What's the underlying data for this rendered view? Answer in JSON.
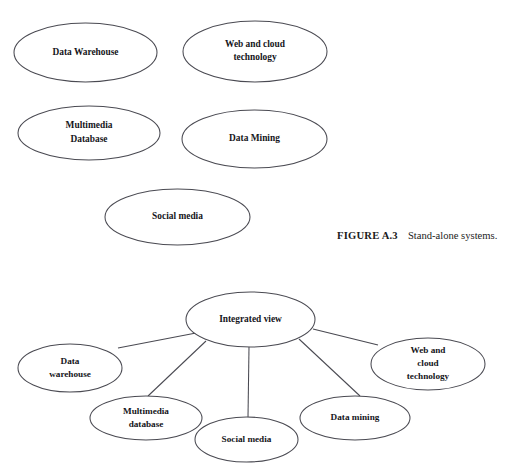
{
  "figure": {
    "caption_tag": "FIGURE A.3",
    "caption_text": "Stand-alone systems.",
    "background_color": "#ffffff",
    "stroke_color": "#4a4a52",
    "text_color": "#15151a"
  },
  "standalone_diagram": {
    "name": "stand-alone-systems",
    "nodes": [
      {
        "id": "data-warehouse",
        "lines": [
          "Data Warehouse"
        ],
        "cx": 85.5,
        "cy": 52.5,
        "rx": 71.5,
        "ry": 29.5,
        "font_size": 9.4
      },
      {
        "id": "web-and-cloud-technology",
        "lines": [
          "Web and cloud",
          "technology"
        ],
        "cx": 255,
        "cy": 51.5,
        "rx": 72,
        "ry": 30.5,
        "font_size": 9.4
      },
      {
        "id": "multimedia-database",
        "lines": [
          "Multimedia",
          "Database"
        ],
        "cx": 89,
        "cy": 133,
        "rx": 71,
        "ry": 27,
        "font_size": 9.4
      },
      {
        "id": "data-mining",
        "lines": [
          "Data Mining"
        ],
        "cx": 254.5,
        "cy": 139,
        "rx": 72.5,
        "ry": 29,
        "font_size": 9.4
      },
      {
        "id": "social-media",
        "lines": [
          "Social media"
        ],
        "cx": 177.5,
        "cy": 217,
        "rx": 72.5,
        "ry": 28,
        "font_size": 9.4
      }
    ]
  },
  "integrated_diagram": {
    "name": "integrated-view-systems",
    "center_node": {
      "id": "integrated-view",
      "lines": [
        "Integrated view"
      ],
      "cx": 250.5,
      "cy": 319.5,
      "rx": 64.5,
      "ry": 27.5,
      "font_size": 9.4
    },
    "nodes": [
      {
        "id": "data-warehouse",
        "lines": [
          "Data",
          "warehouse"
        ],
        "cx": 70,
        "cy": 368,
        "rx": 52,
        "ry": 24,
        "font_size": 9.2
      },
      {
        "id": "multimedia-database",
        "lines": [
          "Multimedia",
          "database"
        ],
        "cx": 146,
        "cy": 418,
        "rx": 56,
        "ry": 22,
        "font_size": 9.2
      },
      {
        "id": "social-media",
        "lines": [
          "Social media"
        ],
        "cx": 246.5,
        "cy": 439.5,
        "rx": 51.5,
        "ry": 22.5,
        "font_size": 9.2
      },
      {
        "id": "data-mining",
        "lines": [
          "Data mining"
        ],
        "cx": 355,
        "cy": 418,
        "rx": 55,
        "ry": 22,
        "font_size": 9.2
      },
      {
        "id": "web-and-cloud-technology",
        "lines": [
          "Web and",
          "cloud",
          "technology"
        ],
        "cx": 428,
        "cy": 364,
        "rx": 57,
        "ry": 26,
        "font_size": 9.2
      }
    ],
    "edges": [
      {
        "id": "integrated-view-to-data-warehouse",
        "x1": 196,
        "y1": 333,
        "x2": 118,
        "y2": 348
      },
      {
        "id": "integrated-view-to-multimedia-database",
        "x1": 206,
        "y1": 341,
        "x2": 148,
        "y2": 396
      },
      {
        "id": "integrated-view-to-social-media",
        "x1": 249,
        "y1": 347,
        "x2": 248,
        "y2": 417
      },
      {
        "id": "integrated-view-to-data-mining",
        "x1": 299,
        "y1": 339,
        "x2": 360,
        "y2": 396
      },
      {
        "id": "integrated-view-to-web-and-cloud-technology",
        "x1": 313,
        "y1": 329,
        "x2": 378,
        "y2": 345
      }
    ]
  },
  "caption_position": {
    "left": 337,
    "top": 225
  }
}
